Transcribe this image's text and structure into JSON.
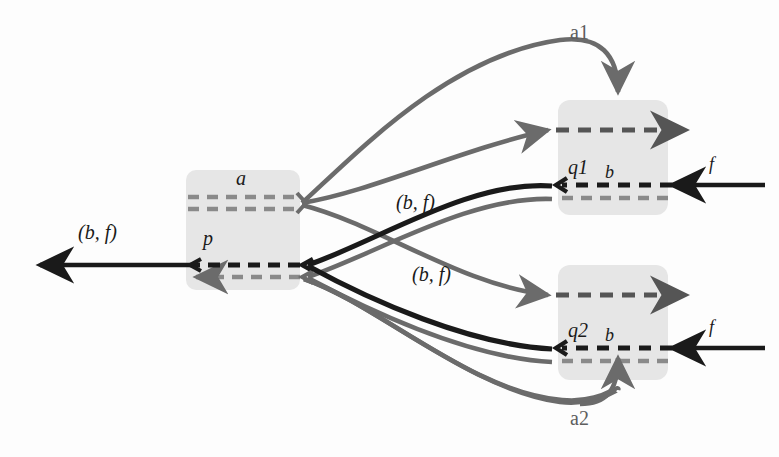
{
  "figure": {
    "type": "process-flow-diagram",
    "background_color": "#fdfdfd",
    "colors": {
      "box_fill": "#e6e6e6",
      "black_edge": "#1a1a1a",
      "gray_edge": "#6b6b6b",
      "gray_dash": "#8a8a8a",
      "text_black": "#1a1a1a",
      "text_gray": "#5e5e5e"
    }
  },
  "nodes": [
    {
      "id": "left-box",
      "labels": [
        "a",
        "p"
      ],
      "label_a": "a",
      "label_p": "p",
      "x": 186,
      "y": 170,
      "w": 114,
      "h": 120
    },
    {
      "id": "q1-box",
      "label_state": "q1",
      "label_symbol": "b",
      "x": 558,
      "y": 100,
      "w": 110,
      "h": 115
    },
    {
      "id": "q2-box",
      "label_state": "q2",
      "label_symbol": "b",
      "x": 558,
      "y": 265,
      "w": 110,
      "h": 115
    }
  ],
  "labels": {
    "a": "a",
    "p": "p",
    "q1": "q1",
    "q2": "q2",
    "b_q1": "b",
    "b_q2": "b",
    "f_top": "f",
    "f_bottom": "f",
    "a1": "a1",
    "a2": "a2",
    "bf_left": "(b, f)",
    "bf_upper": "(b, f)",
    "bf_lower": "(b, f)"
  },
  "edges": [
    {
      "id": "out-left-black",
      "label": "(b, f)",
      "style": "solid-black-arrow-left",
      "from": "left-box",
      "to": "exterior-left"
    },
    {
      "id": "out-left-gray",
      "label": "",
      "style": "solid-gray-arrow-left",
      "from": "left-box",
      "to": "exterior-left"
    },
    {
      "id": "a-to-q1-gray-top",
      "label": "",
      "style": "curve-gray-arrow-right",
      "from": "a-junction",
      "to": "q1-box"
    },
    {
      "id": "a-to-q2-gray",
      "label": "",
      "style": "curve-gray-arrow-right",
      "from": "a-junction",
      "to": "q2-box"
    },
    {
      "id": "q1-to-p-black",
      "label": "(b, f)",
      "style": "curve-black-arrow-left",
      "from": "q1-box",
      "to": "p-junction"
    },
    {
      "id": "q1-to-p-gray",
      "label": "",
      "style": "curve-gray-arrow-left",
      "from": "q1-box",
      "to": "p-junction"
    },
    {
      "id": "q2-to-p-black",
      "label": "(b, f)",
      "style": "curve-black-arrow-left",
      "from": "q2-box",
      "to": "p-junction"
    },
    {
      "id": "q2-to-p-gray",
      "label": "",
      "style": "curve-gray-arrow-left",
      "from": "q2-box",
      "to": "p-junction"
    },
    {
      "id": "a1-curve",
      "label": "a1",
      "style": "curve-gray-arrow-down",
      "from": "a-junction",
      "to": "q1-box-top"
    },
    {
      "id": "a2-curve",
      "label": "a2",
      "style": "curve-gray-arrow-up",
      "from": "p-junction",
      "to": "q2-box-bottom"
    },
    {
      "id": "f-into-q1",
      "label": "f",
      "style": "solid-black-arrow-left",
      "from": "exterior-right",
      "to": "q1-box"
    },
    {
      "id": "f-into-q2",
      "label": "f",
      "style": "solid-black-arrow-left",
      "from": "exterior-right",
      "to": "q2-box"
    },
    {
      "id": "q1-dashed-out-right",
      "label": "",
      "style": "dashed-gray-arrow-right",
      "from": "q1-box",
      "to": "exterior-right"
    },
    {
      "id": "q2-dashed-out-right",
      "label": "",
      "style": "dashed-gray-arrow-right",
      "from": "q2-box",
      "to": "exterior-right"
    }
  ]
}
